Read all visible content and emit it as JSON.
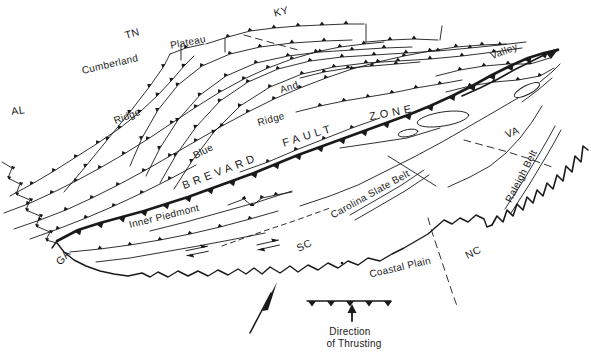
{
  "figure": {
    "background_color": "#ffffff",
    "ink_color": "#1a1a1a"
  },
  "labels": {
    "al": "AL",
    "tn": "TN",
    "ky": "KY",
    "ga": "GA",
    "sc": "SC",
    "nc": "NC",
    "va": "VA",
    "cumberland": "Cumberland",
    "plateau": "Plateau",
    "valley": "Valley",
    "and": "And",
    "ridge_nw": "Ridge",
    "ridge_ne": "Ridge",
    "blue": "Blue",
    "brevard": "BREVARD",
    "fault": "FAULT",
    "zone": "ZONE",
    "inner_piedmont": "Inner Piedmont",
    "carolina_slate_belt": "Carolina Slate Belt",
    "raleigh_belt": "Raleigh Belt",
    "coastal_plain": "Coastal Plain"
  },
  "legend": {
    "caption_line1": "Direction",
    "caption_line2": "of Thrusting",
    "symbol": "thrust-fault-teeth-with-up-arrow"
  },
  "symbols": {
    "thrust_teeth": "thrust-fault-teeth-icon",
    "up_arrow": "up-arrow-icon",
    "north_arrow": "north-arrow-icon"
  }
}
